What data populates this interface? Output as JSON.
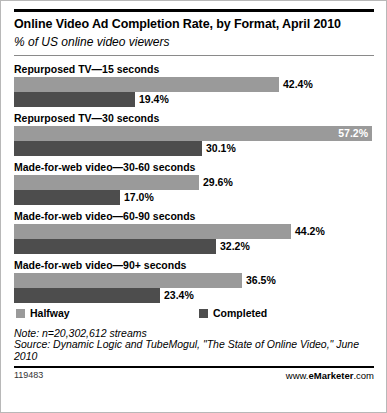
{
  "header": {
    "title": "Online Video Ad Completion Rate, by Format, April 2010",
    "subtitle": "% of US online video viewers"
  },
  "legend": {
    "halfway_label": "Halfway",
    "completed_label": "Completed"
  },
  "notes": {
    "note": "Note: n=20,302,612 streams",
    "source": "Source: Dynamic Logic and TubeMogul, \"The State of Online Video,\" June 2010"
  },
  "footer": {
    "id": "119483",
    "brand_prefix": "www.",
    "brand_name": "eMarketer",
    "brand_suffix": ".com"
  },
  "colors": {
    "halfway": "#9a9a9a",
    "completed": "#4d4d4d",
    "text": "#000000",
    "border": "#b8b8b8"
  },
  "chart_data": {
    "type": "bar",
    "orientation": "horizontal",
    "title": "Online Video Ad Completion Rate, by Format, April 2010",
    "subtitle": "% of US online video viewers",
    "xlabel": "",
    "ylabel": "",
    "xlim": [
      0,
      57.2
    ],
    "grid": false,
    "legend_position": "bottom",
    "categories": [
      "Repurposed TV—15 seconds",
      "Repurposed TV—30 seconds",
      "Made-for-web video—30-60 seconds",
      "Made-for-web video—60-90 seconds",
      "Made-for-web video—90+ seconds"
    ],
    "series": [
      {
        "name": "Halfway",
        "color": "#9a9a9a",
        "values": [
          42.4,
          57.2,
          29.6,
          44.2,
          36.5
        ],
        "labels": [
          "42.4%",
          "57.2%",
          "29.6%",
          "44.2%",
          "36.5%"
        ]
      },
      {
        "name": "Completed",
        "color": "#4d4d4d",
        "values": [
          19.4,
          30.1,
          17.0,
          32.2,
          23.4
        ],
        "labels": [
          "19.4%",
          "30.1%",
          "17.0%",
          "32.2%",
          "23.4%"
        ]
      }
    ],
    "note": "Note: n=20,302,612 streams",
    "source": "Source: Dynamic Logic and TubeMogul, \"The State of Online Video,\" June 2010"
  }
}
